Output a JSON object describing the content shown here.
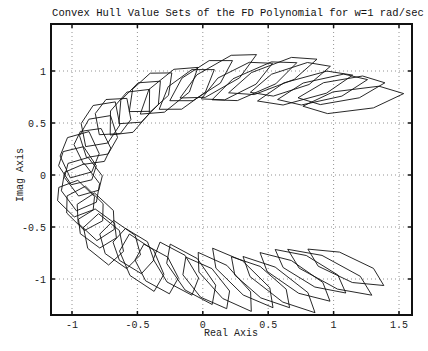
{
  "chart_data": {
    "type": "line",
    "title": "Convex Hull Value Sets of the FD Polynomial for w=1 rad/sec",
    "xlabel": "Real Axis",
    "ylabel": "Imag Axis",
    "xlim": [
      -1.16,
      1.62
    ],
    "ylim": [
      -1.35,
      1.47
    ],
    "xticks": [
      -1,
      -0.5,
      0,
      0.5,
      1,
      1.5
    ],
    "xtick_labels": [
      "-1",
      "-0.5",
      "0",
      "0.5",
      "1",
      "1.5"
    ],
    "yticks": [
      -1,
      -0.5,
      0,
      0.5,
      1
    ],
    "ytick_labels": [
      "-1",
      "-0.5",
      "0",
      "0.5",
      "1"
    ],
    "grid": true,
    "legend": null,
    "series_description": "Overlapping convex polygons (value sets) arranged along a horseshoe-shaped arc opening to the right, centered near (0.35, -0.05)",
    "value_sets": {
      "center_ellipse": {
        "cx": 0.35,
        "cy": -0.05,
        "rx": 1.3,
        "ry": 0.98
      },
      "phi_start_deg": 52,
      "phi_end_deg": 308,
      "phi_step_deg": 6,
      "long_half_axis_top": 0.36,
      "long_half_axis_left": 0.2,
      "short_half_axis": 0.1,
      "skew": 0.35
    }
  },
  "axes": {
    "x_px": {
      "at_minus1": 72,
      "at_1_5": 399
    },
    "y_px": {
      "at_1": 71,
      "at_minus1": 279
    },
    "frame_px": {
      "left": 51,
      "top": 24,
      "right": 412,
      "bottom": 315
    }
  }
}
